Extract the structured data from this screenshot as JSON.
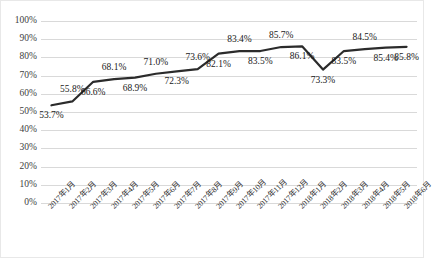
{
  "chart_data": {
    "type": "line",
    "title": "",
    "xlabel": "",
    "ylabel": "",
    "ylim": [
      0,
      100
    ],
    "grid": true,
    "legend": "none",
    "categories": [
      "2017年1月",
      "2017年2月",
      "2017年3月",
      "2017年4月",
      "2017年5月",
      "2017年6月",
      "2017年7月",
      "2017年8月",
      "2017年9月",
      "2017年10月",
      "2017年11月",
      "2017年12月",
      "2018年1月",
      "2018年2月",
      "2018年3月",
      "2018年4月",
      "2018年5月",
      "2018年6月"
    ],
    "values": [
      53.7,
      55.8,
      66.6,
      68.1,
      68.9,
      71.0,
      72.3,
      73.6,
      82.1,
      83.4,
      83.5,
      85.7,
      86.1,
      73.3,
      83.5,
      84.5,
      85.4,
      85.8
    ],
    "data_labels": [
      "53.7%",
      "55.8%",
      "66.6%",
      "68.1%",
      "68.9%",
      "71.0%",
      "72.3%",
      "73.6%",
      "82.1%",
      "83.4%",
      "83.5%",
      "85.7%",
      "86.1%",
      "73.3%",
      "83.5%",
      "84.5%",
      "85.4%",
      "85.8%"
    ],
    "label_positions": [
      "below",
      "above",
      "below",
      "above",
      "below",
      "above",
      "below",
      "above",
      "below",
      "above",
      "below",
      "above",
      "below",
      "below",
      "below",
      "above",
      "below",
      "below"
    ],
    "ytick_labels": [
      "100%",
      "90%",
      "80%",
      "70%",
      "60%",
      "50%",
      "40%",
      "30%",
      "20%",
      "10%",
      "0%"
    ],
    "ytick_values": [
      100,
      90,
      80,
      70,
      60,
      50,
      40,
      30,
      20,
      10,
      0
    ],
    "series_color": "#2b2b2b",
    "gridline_color": "#d9d9d9",
    "plot_background": "#ffffff"
  }
}
